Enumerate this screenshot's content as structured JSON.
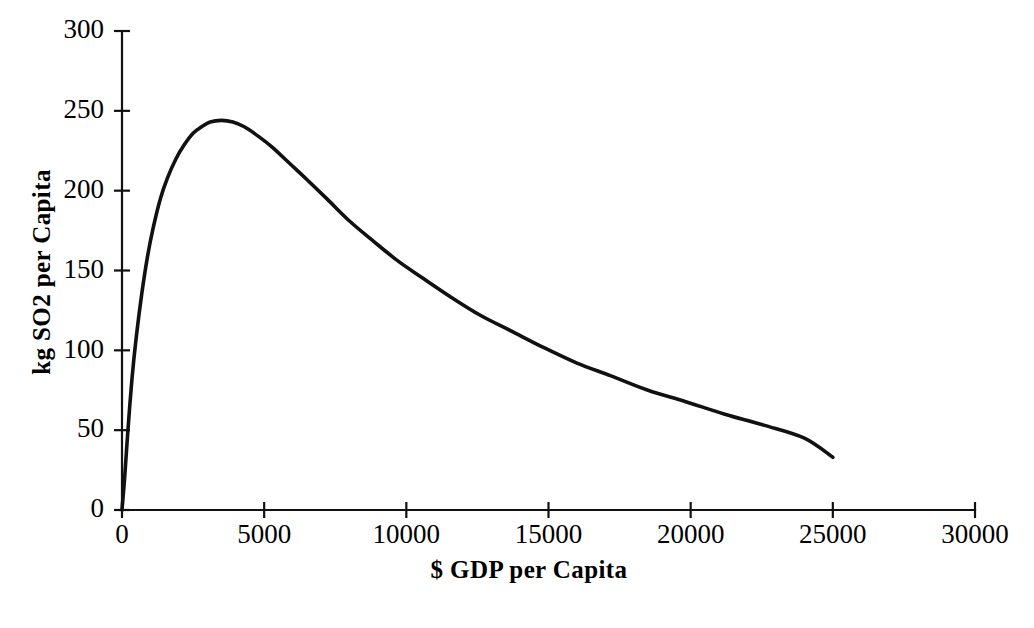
{
  "chart_data": {
    "type": "line",
    "title": "",
    "subtitle": "",
    "xlabel": "$ GDP per Capita",
    "ylabel": "kg SO2 per Capita",
    "xlim": [
      0,
      30000
    ],
    "ylim": [
      0,
      300
    ],
    "grid": false,
    "legend": null,
    "legend_position": "none",
    "xticks": [
      0,
      5000,
      10000,
      15000,
      20000,
      25000,
      30000
    ],
    "xticklabels": [
      "0",
      "5000",
      "10000",
      "15000",
      "20000",
      "25000",
      "30000"
    ],
    "yticks": [
      0,
      50,
      100,
      150,
      200,
      250,
      300
    ],
    "yticklabels": [
      "0",
      "50",
      "100",
      "150",
      "200",
      "250",
      "300"
    ],
    "series": [
      {
        "name": "SO2 emissions per capita",
        "color": "#111111",
        "line_width": 3.6,
        "x": [
          0,
          100,
          200,
          350,
          500,
          700,
          900,
          1100,
          1350,
          1600,
          1900,
          2200,
          2500,
          2800,
          3100,
          3500,
          3900,
          4300,
          4800,
          5300,
          5900,
          6500,
          7200,
          8000,
          8800,
          9700,
          10600,
          11600,
          12600,
          13700,
          14800,
          16000,
          17200,
          18500,
          19800,
          21200,
          22600,
          24000,
          25000
        ],
        "y": [
          0,
          22,
          48,
          82,
          108,
          136,
          159,
          177,
          195,
          208,
          220,
          229,
          236,
          240,
          243,
          244,
          243,
          240,
          234,
          227,
          217,
          207,
          195,
          181,
          169,
          156,
          145,
          133,
          122,
          112,
          102,
          92,
          84,
          75,
          68,
          60,
          53,
          45,
          33
        ]
      }
    ],
    "axis_geometry": {
      "origin_px": [
        122,
        510
      ],
      "x_max_px": 975,
      "y_max_px": 31
    }
  },
  "axes": {
    "x_title": "$ GDP per Capita",
    "y_title": "kg SO2 per Capita"
  }
}
